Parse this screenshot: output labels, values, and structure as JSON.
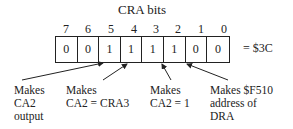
{
  "title": "CRA bits",
  "bit_numbers": [
    "7",
    "6",
    "5",
    "4",
    "3",
    "2",
    "1",
    "0"
  ],
  "bit_values": [
    "0",
    "0",
    "1",
    "1",
    "1",
    "1",
    "0",
    "0"
  ],
  "hex_value": "= $3C",
  "annotations": [
    {
      "lines": [
        "Makes",
        "CA2",
        "output"
      ]
    },
    {
      "lines": [
        "Makes",
        "CA2 = CRA3"
      ]
    },
    {
      "lines": [
        "Makes",
        "CA2 = 1"
      ]
    },
    {
      "lines": [
        "Makes $F510",
        "address of",
        "DRA"
      ]
    }
  ]
}
